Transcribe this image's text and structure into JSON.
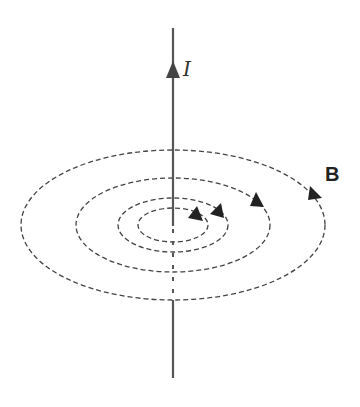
{
  "diagram": {
    "title": "",
    "current_label": "I",
    "field_label": "B",
    "colors": {
      "line": "#444444",
      "wire": "#555555",
      "background": "#ffffff"
    },
    "wire": {
      "x": 173,
      "y_top": 28,
      "y_bottom": 378,
      "direction": "up"
    },
    "field_loops": [
      {
        "rx": 152,
        "ry": 75
      },
      {
        "rx": 97,
        "ry": 47
      },
      {
        "rx": 55,
        "ry": 27
      },
      {
        "rx": 35,
        "ry": 17
      }
    ],
    "center": {
      "x": 173,
      "y": 225
    }
  }
}
